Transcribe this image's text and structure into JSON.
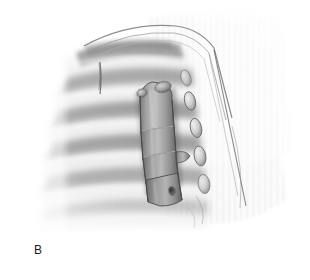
{
  "figure": {
    "panel_label": "B",
    "background_color": "#ffffff",
    "label_color": "#1b1b1b"
  },
  "palette": {
    "white": "#ffffff",
    "paper": "#fdfdfd",
    "rib_light": "#f2f2f2",
    "rib_mid": "#cfcfcf",
    "rib_shadow": "#8d8d8d",
    "deep_shadow": "#6a6a6a",
    "plate_light": "#c9c9c9",
    "plate_mid": "#9a9a9a",
    "plate_dark": "#6e6e6e",
    "plate_edge": "#4e4e4e",
    "outline": "#5a5a5a",
    "hatch": "#e6e6e6",
    "suture_line": "#55555a"
  },
  "elements": {
    "rib_cage": {
      "name": "rib-cage-bands",
      "band_count": 7,
      "orientation": "horizontal-curved"
    },
    "fixation_plate": {
      "name": "rib-fixation-plate",
      "segment_count": 3,
      "screw_hole_count": 2,
      "orientation": "vertical"
    },
    "rib_ends": {
      "name": "rib-end-ovals",
      "count": 5
    },
    "retractor_edge": {
      "name": "tissue-retraction-edge",
      "stroke_count": 3
    },
    "background_hatch": {
      "name": "vertical-hatch-field",
      "line_count": 34
    }
  }
}
